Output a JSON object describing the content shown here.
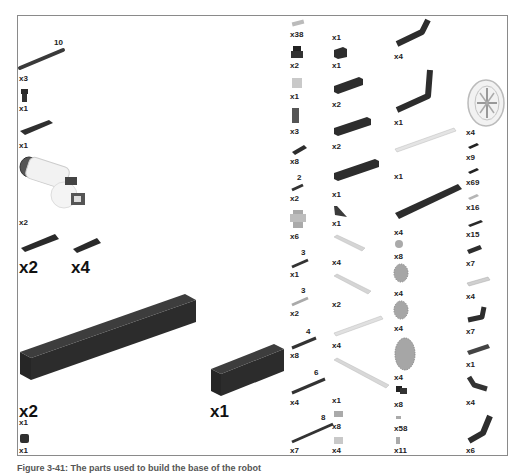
{
  "figure": {
    "caption": "Figure 3-41: The parts used to build the base of the robot"
  },
  "left_column": [
    {
      "name": "axle-10",
      "length": "10",
      "qty": "x3"
    },
    {
      "name": "axle-pin",
      "qty": "x1"
    },
    {
      "name": "plate-2x6",
      "qty": "x1"
    },
    {
      "name": "motor",
      "qty": "x2"
    },
    {
      "name": "pin-long",
      "qty": "x2"
    },
    {
      "name": "pin",
      "qty": "x4"
    },
    {
      "name": "brick-1x16",
      "qty": "x2"
    },
    {
      "name": "brick-1x6",
      "qty": "x1"
    },
    {
      "name": "hidden-part",
      "qty": "x1"
    },
    {
      "name": "brick-round",
      "qty": "x1"
    }
  ],
  "col2": [
    {
      "name": "connector-bush",
      "qty": "x38"
    },
    {
      "name": "pin-3l-friction",
      "qty": "x2"
    },
    {
      "name": "bush-light",
      "qty": "x1"
    },
    {
      "name": "brick-tall",
      "qty": "x3"
    },
    {
      "name": "plate-2x4",
      "qty": "x8"
    },
    {
      "name": "axle-2",
      "length": "2",
      "qty": "x2"
    },
    {
      "name": "cross-block",
      "qty": "x6"
    },
    {
      "name": "axle-3-dark",
      "length": "3",
      "qty": "x1"
    },
    {
      "name": "axle-3-light",
      "length": "3",
      "qty": "x2"
    },
    {
      "name": "axle-4",
      "length": "4",
      "qty": "x8"
    },
    {
      "name": "axle-6",
      "length": "6",
      "qty": "x4"
    },
    {
      "name": "axle-8",
      "length": "8",
      "qty": "x7"
    }
  ],
  "col3": [
    {
      "name": "unknown-top",
      "qty": "x1"
    },
    {
      "name": "brick-1x2",
      "qty": "x1"
    },
    {
      "name": "brick-1x6-a",
      "qty": "x2"
    },
    {
      "name": "brick-1x8",
      "qty": "x2"
    },
    {
      "name": "brick-1x10",
      "qty": "x1"
    },
    {
      "name": "wedge",
      "qty": "x1"
    },
    {
      "name": "beam-9-light",
      "qty": "x4"
    },
    {
      "name": "beam-11-light",
      "qty": "x2"
    },
    {
      "name": "rack",
      "qty": "x4"
    },
    {
      "name": "beam-15-light",
      "qty": "x1"
    },
    {
      "name": "pin-joiner",
      "qty": "x8"
    },
    {
      "name": "axle-joiner",
      "qty": "x4"
    }
  ],
  "col4": [
    {
      "name": "angled-beam-a",
      "qty": "x4"
    },
    {
      "name": "angled-beam-b",
      "qty": "x1"
    },
    {
      "name": "rack-long",
      "qty": "x1"
    },
    {
      "name": "beam-15-dark",
      "qty": "x4"
    },
    {
      "name": "gear-small",
      "qty": "x8"
    },
    {
      "name": "gear-24",
      "qty": "x4"
    },
    {
      "name": "gear-24b",
      "qty": "x4"
    },
    {
      "name": "gear-40",
      "qty": "x4"
    },
    {
      "name": "pin-with-bush",
      "qty": "x8"
    },
    {
      "name": "bush-half",
      "qty": "x58"
    },
    {
      "name": "axle-pin-short",
      "qty": "x11"
    }
  ],
  "col5": [
    {
      "name": "wheel",
      "qty": "x4"
    },
    {
      "name": "pin-black",
      "qty": "x9"
    },
    {
      "name": "pin-black-friction",
      "qty": "x69"
    },
    {
      "name": "pin-light",
      "qty": "x16"
    },
    {
      "name": "axle-pin-long",
      "qty": "x15"
    },
    {
      "name": "beam-3",
      "qty": "x7"
    },
    {
      "name": "beam-5-light",
      "qty": "x4"
    },
    {
      "name": "l-beam",
      "qty": "x7"
    },
    {
      "name": "beam-5-dark",
      "qty": "x1"
    },
    {
      "name": "l-beam-b",
      "qty": "x4"
    },
    {
      "name": "angled-beam-c",
      "qty": "x6"
    }
  ]
}
